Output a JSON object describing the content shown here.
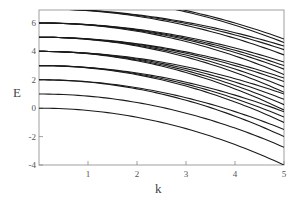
{
  "chart_data": {
    "type": "line",
    "title": "",
    "xlabel": "k",
    "ylabel": "E",
    "xlim": [
      0,
      5
    ],
    "ylim": [
      -4,
      6.9
    ],
    "xticks": [
      1,
      2,
      3,
      4,
      5
    ],
    "yticks": [
      -4,
      -2,
      0,
      2,
      4,
      6
    ],
    "grid": false,
    "legend": null,
    "line_color": "#1a1a1a",
    "model": "E = E0 - a*k^2",
    "series": [
      {
        "name": "E0=0 branch 1",
        "E0": 0,
        "a": 0.16
      },
      {
        "name": "E0=1 branch 1",
        "E0": 1,
        "a": 0.15
      },
      {
        "name": "E0=2 branch 1",
        "E0": 2,
        "a": 0.14
      },
      {
        "name": "E0=2 branch 2",
        "E0": 2,
        "a": 0.16
      },
      {
        "name": "E0=3 branch 1",
        "E0": 3,
        "a": 0.13
      },
      {
        "name": "E0=3 branch 2",
        "E0": 3,
        "a": 0.145
      },
      {
        "name": "E0=3 branch 3",
        "E0": 3,
        "a": 0.16
      },
      {
        "name": "E0=4 branch 1",
        "E0": 4,
        "a": 0.12
      },
      {
        "name": "E0=4 branch 2",
        "E0": 4,
        "a": 0.135
      },
      {
        "name": "E0=4 branch 3",
        "E0": 4,
        "a": 0.15
      },
      {
        "name": "E0=4 branch 4",
        "E0": 4,
        "a": 0.165
      },
      {
        "name": "E0=5 branch 1",
        "E0": 5,
        "a": 0.115
      },
      {
        "name": "E0=5 branch 2",
        "E0": 5,
        "a": 0.125
      },
      {
        "name": "E0=5 branch 3",
        "E0": 5,
        "a": 0.14
      },
      {
        "name": "E0=5 branch 4",
        "E0": 5,
        "a": 0.155
      },
      {
        "name": "E0=6 branch 1",
        "E0": 6,
        "a": 0.11
      },
      {
        "name": "E0=6 branch 2",
        "E0": 6,
        "a": 0.12
      },
      {
        "name": "E0=6 branch 3",
        "E0": 6,
        "a": 0.13
      },
      {
        "name": "E0=6 branch 4",
        "E0": 6,
        "a": 0.145
      },
      {
        "name": "E0=7 branch 1",
        "E0": 7,
        "a": 0.105
      },
      {
        "name": "E0=7 branch 2",
        "E0": 7,
        "a": 0.115
      },
      {
        "name": "E0=7 branch 3",
        "E0": 7,
        "a": 0.13
      },
      {
        "name": "E0=8 branch 1",
        "E0": 8,
        "a": 0.125
      },
      {
        "name": "E0=8 branch 2",
        "E0": 8,
        "a": 0.135
      }
    ]
  }
}
